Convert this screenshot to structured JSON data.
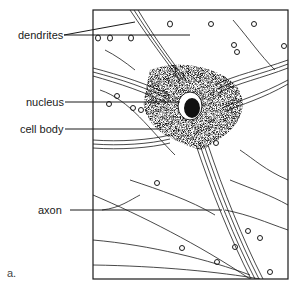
{
  "figure": {
    "panel_label": "a.",
    "labels": [
      {
        "id": "dendrites",
        "text": "dendrites"
      },
      {
        "id": "nucleus",
        "text": "nucleus"
      },
      {
        "id": "cell_body",
        "text": "cell body"
      },
      {
        "id": "axon",
        "text": "axon"
      }
    ]
  },
  "colors": {
    "ink": "#1a1a1a",
    "background": "#ffffff"
  }
}
